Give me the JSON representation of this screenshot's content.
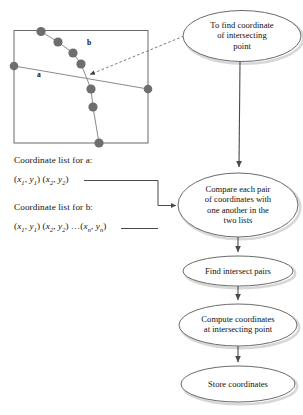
{
  "diagram": {
    "title_region": {
      "box_labels": [
        {
          "name": "line-a-label",
          "text": "a"
        },
        {
          "name": "line-b-label",
          "text": "b"
        }
      ]
    },
    "lists": [
      {
        "name": "coordinate-list-a",
        "heading": "Coordinate list for a:",
        "values": "(x1, y1) (x2, y2)"
      },
      {
        "name": "coordinate-list-b",
        "heading": "Coordinate list for b:",
        "values": "(x1, y1) (x2, y2) ...(xn, yn)"
      }
    ],
    "nodes": [
      {
        "id": "n1",
        "name": "node-find-coordinate",
        "label": "To find coordinate of intersecting point",
        "lines": [
          "To find coordinate",
          "of intersecting",
          "point"
        ]
      },
      {
        "id": "n2",
        "name": "node-compare-pairs",
        "label": "Compare each pair of coordinates with one another in the two lists",
        "lines": [
          "Compare each pair",
          "of coordinates with",
          "one another in the",
          "two lists"
        ]
      },
      {
        "id": "n3",
        "name": "node-find-intersect-pairs",
        "label": "Find intersect pairs",
        "lines": [
          "Find intersect pairs"
        ]
      },
      {
        "id": "n4",
        "name": "node-compute-coordinates",
        "label": "Compute coordinates at intersecting point",
        "lines": [
          "Compute coordinates",
          "at intersecting point"
        ]
      },
      {
        "id": "n5",
        "name": "node-store-coordinates",
        "label": "Store coordinates",
        "lines": [
          "Store coordinates"
        ]
      }
    ],
    "colors": {
      "stroke": "#555555",
      "oval_stroke": "#6b6b6b",
      "node_fill": "#6e6e6e",
      "text": "#111111",
      "background": "#ffffff",
      "shadow": "#cfcfcf"
    },
    "map_panel": {
      "name": "map-panel",
      "line_a_points": "left-edge to right-edge",
      "line_b_vertex_count": 8
    }
  }
}
